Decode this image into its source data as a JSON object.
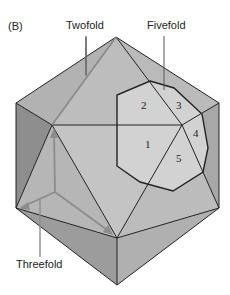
{
  "panel_label": "(B)",
  "labels": {
    "twofold": "Twofold",
    "fivefold": "Fivefold",
    "threefold": "Threefold"
  },
  "face_numbers": [
    "1",
    "2",
    "3",
    "4",
    "5"
  ],
  "colors": {
    "face_light": "#c8c8c8",
    "face_mid": "#b4b4b4",
    "face_dark": "#9a9a9a",
    "face_darker": "#8a8a8a",
    "pentagon_fill": "#d4d4d4",
    "edge": "#222222",
    "axis_gray": "#8c8c8c"
  }
}
